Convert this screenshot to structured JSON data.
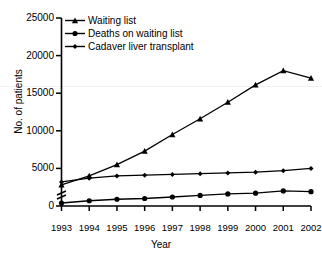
{
  "header": {
    "fragment_tag": "",
    "fragment_title": ""
  },
  "chart_data": {
    "type": "line",
    "title": "",
    "xlabel": "Year",
    "ylabel": "No. of patients",
    "x": [
      1993,
      1994,
      1995,
      1996,
      1997,
      1998,
      1999,
      2000,
      2001,
      2002
    ],
    "xtick_labels": [
      "1993",
      "1994",
      "1995",
      "1996",
      "1997",
      "1998",
      "1999",
      "2000",
      "2001",
      "2002"
    ],
    "ylim": [
      0,
      25000
    ],
    "ytick_labels": [
      "0",
      "5000",
      "10000",
      "15000",
      "20000",
      "25000"
    ],
    "yticks": [
      0,
      5000,
      10000,
      15000,
      20000,
      25000
    ],
    "axis_break": true,
    "grid": false,
    "legend_position": "top-left",
    "series": [
      {
        "name": "Waiting list",
        "marker": "triangle",
        "values": [
          2800,
          4000,
          5500,
          7300,
          9500,
          11600,
          13800,
          16100,
          18000,
          17000
        ]
      },
      {
        "name": "Deaths on waiting list",
        "marker": "circle",
        "values": [
          400,
          700,
          900,
          1000,
          1200,
          1400,
          1600,
          1700,
          2000,
          1900
        ]
      },
      {
        "name": "Cadaver liver transplant",
        "marker": "diamond",
        "values": [
          3200,
          3700,
          4000,
          4100,
          4200,
          4300,
          4400,
          4500,
          4700,
          5000
        ]
      }
    ]
  }
}
